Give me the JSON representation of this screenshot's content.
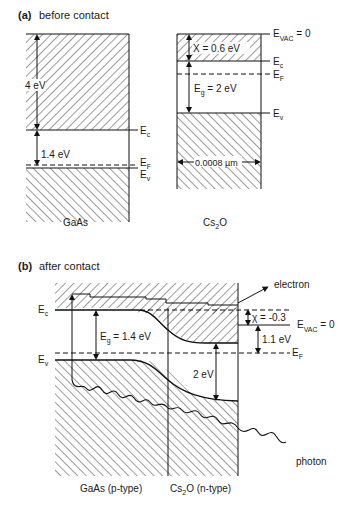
{
  "panel_a": {
    "tag": "(a)",
    "title": "before contact",
    "gaas": {
      "label": "GaAs",
      "affinity": "4 eV",
      "gap": "1.4 eV",
      "levels": {
        "ec": "E",
        "ec_sub": "c",
        "ef": "E",
        "ef_sub": "F",
        "ev": "E",
        "ev_sub": "v"
      }
    },
    "cs2o": {
      "label_main": "Cs",
      "label_sub": "2",
      "label_end": "O",
      "affinity": "X = 0.6 eV",
      "gap_main": "E",
      "gap_sub": "g",
      "gap_value": " = 2 eV",
      "thickness": "0.0008 µm",
      "levels": {
        "vac": "E",
        "vac_sub": "VAC",
        "vac_value": " = 0",
        "ec": "E",
        "ec_sub": "c",
        "ef": "E",
        "ef_sub": "F",
        "ev": "E",
        "ev_sub": "v"
      }
    }
  },
  "panel_b": {
    "tag": "(b)",
    "title": "after contact",
    "left_levels": {
      "ec": "E",
      "ec_sub": "c",
      "ev": "E",
      "ev_sub": "v"
    },
    "gap_main": "E",
    "gap_sub": "g",
    "gap_value": " = 1.4 eV",
    "cs2o_gap": "2 eV",
    "affinity": "χ = -0.3",
    "barrier": "1.1 eV",
    "vac": {
      "main": "E",
      "sub": "VAC",
      "value": " = 0"
    },
    "ef": {
      "main": "E",
      "sub": "F"
    },
    "electron_label": "electron",
    "photon_label": "photon",
    "gaas_label": "GaAs (p-type)",
    "cs2o_label_main": "Cs",
    "cs2o_label_sub": "2",
    "cs2o_label_end": "O (n-type)"
  }
}
